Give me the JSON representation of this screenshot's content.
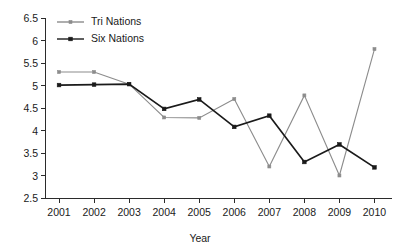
{
  "chart_data": {
    "type": "line",
    "title": "",
    "xlabel": "Year",
    "ylabel": "",
    "categories": [
      "2001",
      "2002",
      "2003",
      "2004",
      "2005",
      "2006",
      "2007",
      "2008",
      "2009",
      "2010"
    ],
    "x": [
      2001,
      2002,
      2003,
      2004,
      2005,
      2006,
      2007,
      2008,
      2009,
      2010
    ],
    "xlim": [
      2000.6,
      2010.5
    ],
    "ylim": [
      2.5,
      6.5
    ],
    "yticks": [
      2.5,
      3,
      3.5,
      4,
      4.5,
      5,
      5.5,
      6,
      6.5
    ],
    "ytick_labels": [
      "2.5",
      "3",
      "3.5",
      "4",
      "4.5",
      "5",
      "5.5",
      "6",
      "6.5"
    ],
    "grid": false,
    "legend_position": "top-left",
    "series": [
      {
        "name": "Tri Nations",
        "color": "#8c8c8c",
        "marker": "square",
        "values": [
          5.3,
          5.3,
          5.03,
          4.29,
          4.28,
          4.7,
          3.2,
          4.78,
          3.0,
          5.81
        ]
      },
      {
        "name": "Six Nations",
        "color": "#1a1a1a",
        "marker": "square",
        "values": [
          5.01,
          5.02,
          5.03,
          4.48,
          4.69,
          4.08,
          4.33,
          3.3,
          3.69,
          3.18
        ]
      }
    ]
  },
  "legend": {
    "items": [
      {
        "label": "Tri Nations"
      },
      {
        "label": "Six Nations"
      }
    ]
  },
  "axes": {
    "x_title": "Year"
  }
}
